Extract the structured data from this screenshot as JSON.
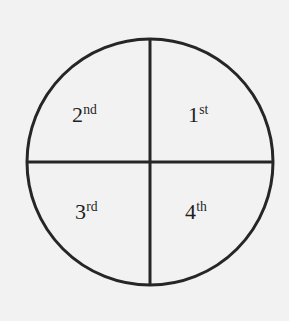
{
  "diagram": {
    "name": "four-quadrant-circle",
    "background_color": "#f2f2f2",
    "stroke_color": "#262626",
    "text_color": "#1f1f1f",
    "circle": {
      "center_x": 150,
      "center_y": 162,
      "radius": 123,
      "stroke_width": 3
    },
    "vertical_diameter": {
      "x": 150,
      "y_start": 39,
      "y_end": 285,
      "stroke_width": 3
    },
    "horizontal_diameter": {
      "y": 162,
      "x_start": 27,
      "x_end": 273,
      "stroke_width": 3
    },
    "quadrants": [
      {
        "id": "q1",
        "position": "top-right",
        "number": "1",
        "suffix": "st",
        "label": "1st"
      },
      {
        "id": "q2",
        "position": "top-left",
        "number": "2",
        "suffix": "nd",
        "label": "2nd"
      },
      {
        "id": "q3",
        "position": "bottom-left",
        "number": "3",
        "suffix": "rd",
        "label": "3rd"
      },
      {
        "id": "q4",
        "position": "bottom-right",
        "number": "4",
        "suffix": "th",
        "label": "4th"
      }
    ]
  }
}
